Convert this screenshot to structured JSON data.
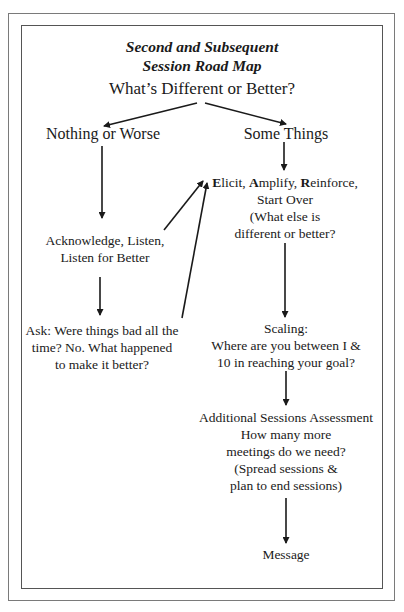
{
  "diagram": {
    "title_lines": [
      "Second and Subsequent",
      "Session Road Map"
    ],
    "root_question": "What’s Different or Better?",
    "left_branch": {
      "label": "Nothing or Worse",
      "acknowledge_lines": [
        "Acknowledge, Listen,",
        "Listen for Better"
      ],
      "ask_lines": [
        "Ask: Were things bad all the",
        "time? No. What happened",
        "to make it better?"
      ]
    },
    "right_branch": {
      "label": "Some Things",
      "ear": {
        "line1": {
          "e_initial": "E",
          "e_rest": "licit, ",
          "a_initial": "A",
          "a_rest": "mplify, ",
          "r_initial": "R",
          "r_rest": "einforce,"
        },
        "other_lines": [
          "Start Over",
          "(What else is",
          "different or better?"
        ]
      },
      "scaling_lines": [
        "Scaling:",
        "Where are you between I &",
        "10 in reaching your goal?"
      ],
      "assessment_lines": [
        "Additional Sessions Assessment",
        "How many more",
        "meetings do we need?",
        "(Spread sessions &",
        "plan to end sessions)"
      ],
      "final": "Message"
    },
    "edges": [
      {
        "from": "root_question",
        "to": "left_branch"
      },
      {
        "from": "root_question",
        "to": "right_branch"
      },
      {
        "from": "left_branch",
        "to": "acknowledge"
      },
      {
        "from": "acknowledge",
        "to": "ask"
      },
      {
        "from": "acknowledge",
        "to": "ear"
      },
      {
        "from": "ask",
        "to": "ear"
      },
      {
        "from": "right_branch",
        "to": "ear"
      },
      {
        "from": "ear",
        "to": "scaling"
      },
      {
        "from": "scaling",
        "to": "assessment"
      },
      {
        "from": "assessment",
        "to": "message"
      }
    ],
    "colors": {
      "text": "#1a1a1a",
      "arrow": "#1a1a1a",
      "frame": "#666666"
    }
  }
}
